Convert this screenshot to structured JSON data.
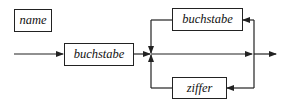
{
  "diagram": {
    "type": "syntax-diagram",
    "rule_label": "name",
    "nodes": {
      "first": "buchstabe",
      "loop_top": "buchstabe",
      "loop_bottom": "ziffer"
    },
    "colors": {
      "stroke": "#222222",
      "background": "#ffffff"
    }
  }
}
